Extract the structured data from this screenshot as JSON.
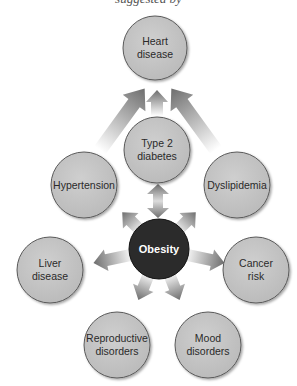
{
  "header": {
    "partial_text": "suggested by"
  },
  "center_node": {
    "id": "obesity",
    "label": "Obesity",
    "cx": 159,
    "cy": 249,
    "r": 30,
    "fill": "#2b2b2b"
  },
  "nodes": [
    {
      "id": "heart",
      "label": "Heart\ndisease",
      "cx": 155,
      "cy": 48,
      "r": 32
    },
    {
      "id": "diabetes",
      "label": "Type 2\ndiabetes",
      "cx": 157,
      "cy": 150,
      "r": 33
    },
    {
      "id": "hypertension",
      "label": "Hypertension",
      "cx": 84,
      "cy": 185,
      "r": 33
    },
    {
      "id": "dyslipidemia",
      "label": "Dyslipidemia",
      "cx": 237,
      "cy": 185,
      "r": 33
    },
    {
      "id": "liver",
      "label": "Liver\ndisease",
      "cx": 50,
      "cy": 270,
      "r": 33
    },
    {
      "id": "cancer",
      "label": "Cancer\nrisk",
      "cx": 256,
      "cy": 270,
      "r": 33
    },
    {
      "id": "reproductive",
      "label": "Reproductive\ndisorders",
      "cx": 117,
      "cy": 345,
      "r": 33
    },
    {
      "id": "mood",
      "label": "Mood\ndisorders",
      "cx": 208,
      "cy": 345,
      "r": 33
    }
  ],
  "colors": {
    "node_fill": "#c4c4c4",
    "node_stroke": "#5a5a5a",
    "center_fill": "#2b2b2b",
    "arrow_dark": "#6e6e6e",
    "arrow_light": "#ffffff"
  },
  "edges": [
    {
      "from": "obesity",
      "to": "diabetes",
      "type": "bidirectional"
    },
    {
      "from": "obesity",
      "to": "hypertension"
    },
    {
      "from": "obesity",
      "to": "dyslipidemia"
    },
    {
      "from": "obesity",
      "to": "liver"
    },
    {
      "from": "obesity",
      "to": "cancer"
    },
    {
      "from": "obesity",
      "to": "reproductive"
    },
    {
      "from": "obesity",
      "to": "mood"
    },
    {
      "from": "diabetes",
      "to": "heart"
    },
    {
      "from": "hypertension",
      "to": "heart"
    },
    {
      "from": "dyslipidemia",
      "to": "heart"
    }
  ]
}
